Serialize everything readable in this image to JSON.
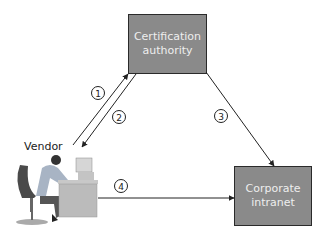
{
  "nodes": {
    "ca": {
      "label": "Certification\nauthority"
    },
    "intranet": {
      "label": "Corporate\nintranet"
    },
    "vendor": {
      "label": "Vendor"
    }
  },
  "edges": [
    {
      "step": "1",
      "from": "vendor",
      "to": "ca"
    },
    {
      "step": "2",
      "from": "ca",
      "to": "vendor"
    },
    {
      "step": "3",
      "from": "ca",
      "to": "intranet"
    },
    {
      "step": "4",
      "from": "vendor",
      "to": "intranet"
    }
  ],
  "colors": {
    "box_fill": "#8a8a8a",
    "box_border": "#2a2a2a",
    "box_text": "#eeeeee",
    "line": "#222222"
  }
}
